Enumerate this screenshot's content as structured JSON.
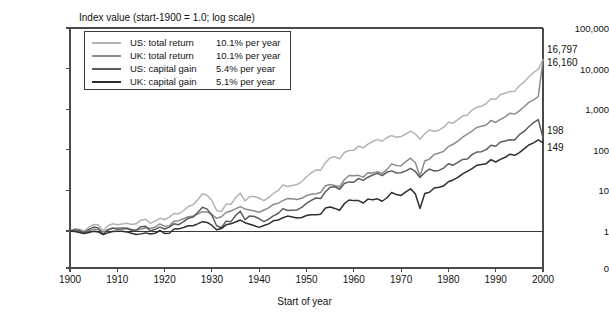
{
  "chart_data": {
    "type": "line",
    "title": "Index value (start-1900 = 1.0; log scale)",
    "xlabel": "Start of year",
    "ylabel": "",
    "log_scale": true,
    "grid": false,
    "legend_position": "top-left",
    "xlim": [
      1900,
      2000
    ],
    "ylim": [
      1,
      100000
    ],
    "xticks": [
      "1900",
      "1910",
      "1920",
      "1930",
      "1940",
      "1950",
      "1960",
      "1970",
      "1980",
      "1990",
      "2000"
    ],
    "yticks": [
      "100,000",
      "10,000",
      "1,000",
      "100",
      "10",
      "1",
      "0"
    ],
    "baseline_value": 1.0,
    "end_labels": [
      {
        "text": "16,797",
        "value": 16797,
        "series": "US: total return"
      },
      {
        "text": "16,160",
        "value": 16160,
        "series": "UK: total return"
      },
      {
        "text": "198",
        "value": 198,
        "series": "US: capital gain"
      },
      {
        "text": "149",
        "value": 149,
        "series": "UK: capital gain"
      }
    ],
    "x": [
      1900,
      1901,
      1902,
      1903,
      1904,
      1905,
      1906,
      1907,
      1908,
      1909,
      1910,
      1911,
      1912,
      1913,
      1914,
      1915,
      1916,
      1917,
      1918,
      1919,
      1920,
      1921,
      1922,
      1923,
      1924,
      1925,
      1926,
      1927,
      1928,
      1929,
      1930,
      1931,
      1932,
      1933,
      1934,
      1935,
      1936,
      1937,
      1938,
      1939,
      1940,
      1941,
      1942,
      1943,
      1944,
      1945,
      1946,
      1947,
      1948,
      1949,
      1950,
      1951,
      1952,
      1953,
      1954,
      1955,
      1956,
      1957,
      1958,
      1959,
      1960,
      1961,
      1962,
      1963,
      1964,
      1965,
      1966,
      1967,
      1968,
      1969,
      1970,
      1971,
      1972,
      1973,
      1974,
      1975,
      1976,
      1977,
      1978,
      1979,
      1980,
      1981,
      1982,
      1983,
      1984,
      1985,
      1986,
      1987,
      1988,
      1989,
      1990,
      1991,
      1992,
      1993,
      1994,
      1995,
      1996,
      1997,
      1998,
      1999,
      2000
    ],
    "series": [
      {
        "name": "US: total return",
        "label": "US: total return",
        "rate": "10.1% per year",
        "color": "#b3b3b3",
        "values": [
          1.0,
          1.13,
          1.1,
          1.0,
          1.25,
          1.45,
          1.4,
          1.0,
          1.35,
          1.5,
          1.42,
          1.48,
          1.55,
          1.45,
          1.5,
          1.85,
          1.95,
          1.55,
          1.75,
          2.05,
          1.9,
          2.2,
          2.7,
          2.65,
          3.2,
          4.0,
          4.4,
          5.9,
          8.3,
          7.6,
          5.6,
          3.2,
          3.0,
          4.6,
          4.5,
          6.6,
          8.6,
          5.5,
          7.1,
          7.1,
          6.4,
          5.6,
          6.7,
          8.4,
          10.0,
          13.6,
          12.5,
          13.2,
          13.9,
          16.5,
          21.7,
          26.9,
          31.9,
          31.5,
          48.1,
          63.2,
          67.3,
          60.0,
          86.0,
          96.3,
          96.8,
          122.8,
          112.0,
          137.5,
          160.2,
          180.2,
          162.1,
          200.9,
          223.0,
          204.1,
          212.2,
          242.5,
          288.5,
          246.2,
          181.0,
          248.5,
          307.8,
          285.8,
          304.5,
          360.9,
          478.0,
          454.4,
          552.3,
          676.8,
          719.2,
          947.2,
          1123.0,
          1182.0,
          1378.0,
          1814.0,
          1757.0,
          2292.0,
          2467.0,
          2715.0,
          2751.0,
          3784.0,
          4653.0,
          6205.0,
          7978.0,
          9656.0,
          16797.0
        ]
      },
      {
        "name": "UK: total return",
        "label": "UK: total return",
        "rate": "10.1% per year",
        "color": "#8c8c8c",
        "values": [
          1.0,
          1.02,
          0.98,
          0.95,
          1.02,
          1.1,
          1.08,
          0.95,
          1.05,
          1.15,
          1.18,
          1.2,
          1.18,
          1.1,
          1.05,
          1.1,
          1.2,
          1.15,
          1.25,
          1.5,
          1.3,
          1.35,
          1.75,
          1.8,
          2.0,
          2.25,
          2.3,
          2.6,
          3.0,
          2.95,
          2.55,
          2.05,
          2.25,
          2.85,
          3.1,
          3.5,
          4.0,
          3.5,
          3.3,
          3.1,
          2.9,
          3.3,
          3.7,
          4.5,
          4.8,
          5.6,
          6.3,
          6.2,
          6.0,
          6.4,
          7.4,
          8.0,
          8.3,
          8.9,
          13.0,
          14.0,
          13.2,
          12.3,
          18.3,
          23.2,
          23.0,
          23.5,
          21.2,
          27.3,
          27.0,
          28.9,
          26.0,
          32.5,
          45.0,
          41.0,
          40.5,
          51.0,
          62.0,
          48.5,
          22.0,
          53.0,
          59.0,
          77.0,
          83.0,
          92.0,
          120.0,
          137.0,
          163.0,
          204.0,
          242.0,
          290.0,
          357.0,
          382.0,
          410.0,
          530.0,
          472.0,
          562.0,
          648.0,
          790.0,
          760.0,
          910.0,
          1150.0,
          1470.0,
          1700.0,
          2050.0,
          16160.0
        ]
      },
      {
        "name": "US: capital gain",
        "label": "US: capital gain",
        "rate": "5.4% per year",
        "color": "#5c5c5c",
        "values": [
          1.0,
          1.08,
          1.03,
          0.9,
          1.1,
          1.25,
          1.18,
          0.82,
          1.08,
          1.18,
          1.1,
          1.12,
          1.15,
          1.04,
          1.05,
          1.28,
          1.3,
          1.0,
          1.1,
          1.25,
          1.12,
          1.25,
          1.5,
          1.43,
          1.7,
          2.05,
          2.2,
          2.85,
          3.85,
          3.45,
          2.45,
          1.35,
          1.2,
          1.75,
          1.68,
          2.4,
          3.05,
          1.9,
          2.35,
          2.28,
          2.0,
          1.7,
          1.95,
          2.35,
          2.7,
          3.55,
          3.2,
          3.25,
          3.3,
          3.8,
          4.8,
          5.7,
          6.5,
          6.3,
          9.3,
          11.9,
          12.3,
          10.7,
          14.8,
          16.2,
          15.9,
          19.7,
          17.6,
          21.1,
          24.0,
          26.3,
          23.1,
          27.9,
          30.3,
          26.9,
          27.2,
          30.2,
          34.9,
          29.3,
          20.8,
          27.7,
          33.5,
          30.1,
          31.1,
          35.5,
          45.5,
          41.8,
          49.2,
          58.0,
          59.5,
          76.0,
          88.0,
          90.0,
          101.0,
          129.0,
          122.0,
          156.0,
          164.0,
          177.0,
          175.0,
          235.0,
          283.0,
          369.0,
          465.0,
          553.0,
          198.0
        ]
      },
      {
        "name": "UK: capital gain",
        "label": "UK: capital gain",
        "rate": "5.1% per year",
        "color": "#2e2e2e",
        "values": [
          1.0,
          0.97,
          0.92,
          0.87,
          0.92,
          0.98,
          0.95,
          0.82,
          0.9,
          0.97,
          0.98,
          0.98,
          0.95,
          0.88,
          0.82,
          0.85,
          0.9,
          0.84,
          0.88,
          1.03,
          0.87,
          0.88,
          1.12,
          1.13,
          1.22,
          1.35,
          1.35,
          1.5,
          1.7,
          1.63,
          1.37,
          1.07,
          1.15,
          1.42,
          1.5,
          1.66,
          1.86,
          1.6,
          1.47,
          1.35,
          1.23,
          1.37,
          1.5,
          1.78,
          1.86,
          2.12,
          2.33,
          2.22,
          2.08,
          2.15,
          2.4,
          2.5,
          2.5,
          2.6,
          3.7,
          3.9,
          3.6,
          3.25,
          4.7,
          5.8,
          5.6,
          5.6,
          4.9,
          6.1,
          5.9,
          6.2,
          5.4,
          6.6,
          8.9,
          7.9,
          7.5,
          9.2,
          10.9,
          8.3,
          3.6,
          8.4,
          9.0,
          11.5,
          12.0,
          12.9,
          16.3,
          18.1,
          21.0,
          25.6,
          29.5,
          34.5,
          41.5,
          43.5,
          45.5,
          57.5,
          50.0,
          58.0,
          65.5,
          78.0,
          73.0,
          85.5,
          105.0,
          131.0,
          148.0,
          175.0,
          149.0
        ]
      }
    ]
  }
}
